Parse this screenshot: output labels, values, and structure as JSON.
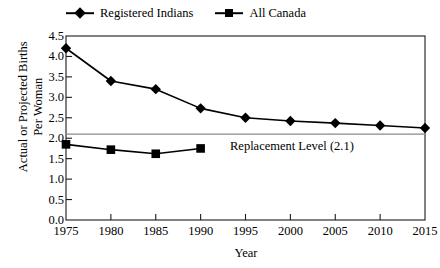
{
  "chart_data": {
    "type": "line",
    "title": "",
    "xlabel": "Year",
    "ylabel": "Actual or Projected Births Per Woman",
    "ylabel_line1": "Actual or Projected Births",
    "ylabel_line2": "Per Woman",
    "x": [
      1975,
      1980,
      1985,
      1990,
      1995,
      2000,
      2005,
      2010,
      2015
    ],
    "xlim": [
      1975,
      2015
    ],
    "ylim": [
      0.0,
      4.5
    ],
    "xticks": [
      "1975",
      "1980",
      "1985",
      "1990",
      "1995",
      "2000",
      "2005",
      "2010",
      "2015"
    ],
    "yticks": [
      "0.0",
      "0.5",
      "1.0",
      "1.5",
      "2.0",
      "2.5",
      "3.0",
      "3.5",
      "4.0",
      "4.5"
    ],
    "grid": false,
    "legend_position": "top",
    "series": [
      {
        "name": "Registered Indians",
        "marker": "diamond",
        "color": "#000000",
        "x": [
          1975,
          1980,
          1985,
          1990,
          1995,
          2000,
          2005,
          2010,
          2015
        ],
        "values": [
          4.2,
          3.4,
          3.2,
          2.73,
          2.5,
          2.42,
          2.37,
          2.31,
          2.25
        ]
      },
      {
        "name": "All Canada",
        "marker": "square",
        "color": "#000000",
        "x": [
          1975,
          1980,
          1985,
          1990
        ],
        "values": [
          1.85,
          1.72,
          1.62,
          1.75
        ]
      }
    ],
    "annotations": [
      {
        "text": "Replacement Level (2.1)",
        "value": 2.1,
        "type": "hline-label"
      }
    ]
  }
}
